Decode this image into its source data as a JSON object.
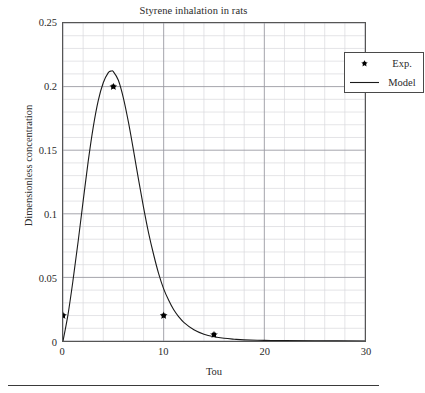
{
  "chart_data": {
    "type": "line",
    "title": "Styrene inhalation in rats",
    "xlabel": "Tou",
    "ylabel": "Dimensionless concentration",
    "xlim": [
      0,
      30
    ],
    "ylim": [
      0,
      0.25
    ],
    "xticks": [
      0,
      10,
      20,
      30
    ],
    "xtick_labels": [
      "0",
      "10",
      "20",
      "30"
    ],
    "yticks": [
      0,
      0.05,
      0.1,
      0.15,
      0.2,
      0.25
    ],
    "ytick_labels": [
      "0",
      "0.05",
      "0.1",
      "0.15",
      "0.2",
      "0.25"
    ],
    "x_minor_step": 2,
    "y_minor_step": 0.01,
    "grid": true,
    "legend_position": "upper right",
    "series": [
      {
        "name": "Exp.",
        "type": "scatter",
        "marker": "star",
        "color": "#000000",
        "x": [
          0,
          5,
          10,
          15
        ],
        "y": [
          0.02,
          0.2,
          0.02,
          0.005
        ]
      },
      {
        "name": "Model",
        "type": "line",
        "color": "#1a1a1a",
        "x": [
          0,
          0.5,
          1,
          1.5,
          2,
          2.5,
          3,
          3.5,
          4,
          4.5,
          4.8,
          5,
          5.5,
          6,
          6.5,
          7,
          7.5,
          8,
          8.5,
          9,
          9.5,
          10,
          10.5,
          11,
          11.5,
          12,
          13,
          14,
          15,
          16,
          17,
          18,
          20,
          22,
          25,
          30
        ],
        "y": [
          0.0,
          0.021,
          0.048,
          0.078,
          0.11,
          0.141,
          0.168,
          0.189,
          0.203,
          0.211,
          0.2122,
          0.2118,
          0.205,
          0.191,
          0.172,
          0.15,
          0.127,
          0.105,
          0.085,
          0.068,
          0.053,
          0.041,
          0.032,
          0.0245,
          0.019,
          0.0147,
          0.0088,
          0.0053,
          0.0033,
          0.0021,
          0.0014,
          0.0009,
          0.0005,
          0.0003,
          0.00015,
          5e-05
        ]
      }
    ]
  },
  "legend": {
    "entries": [
      {
        "label": "Exp.",
        "symbol": "star-marker"
      },
      {
        "label": "Model",
        "symbol": "line-sample"
      }
    ]
  }
}
